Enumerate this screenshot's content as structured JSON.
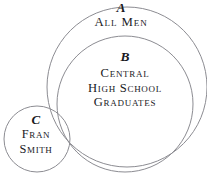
{
  "diagram": {
    "kind": "euler-venn-diagram",
    "background_color": "#ffffff",
    "stroke_color": "#8c8c92",
    "stroke_width": 1,
    "text_color": "#19191e",
    "sets": [
      {
        "id": "a",
        "letter": "A",
        "caption": "All Men",
        "caption_lines": [
          "All Men"
        ],
        "shape": "circle",
        "cx": 127,
        "cy": 87,
        "r": 80
      },
      {
        "id": "b",
        "letter": "B",
        "caption": "Central High School Graduates",
        "caption_lines": [
          "Central",
          "High School",
          "Graduates"
        ],
        "shape": "circle",
        "cx": 125,
        "cy": 104,
        "r": 68
      },
      {
        "id": "c",
        "letter": "C",
        "caption": "Fran Smith",
        "caption_lines": [
          "Fran",
          "Smith"
        ],
        "shape": "circle",
        "cx": 37,
        "cy": 139,
        "r": 33
      }
    ]
  }
}
